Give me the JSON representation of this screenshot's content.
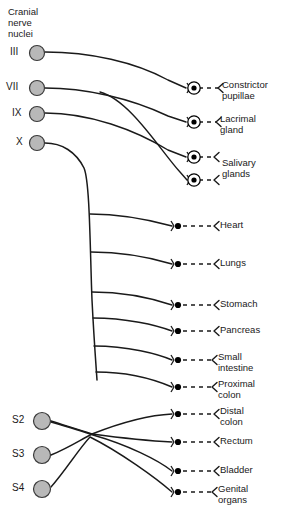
{
  "figure": {
    "heading": "Cranial\nnerve\nnuclei",
    "colors": {
      "background": "#ffffff",
      "line": "#1a1a1a",
      "nucleus_fill": "#b8b8b8",
      "nucleus_stroke": "#3a3a3a",
      "ganglion": "#000000",
      "text": "#1a1a1a"
    }
  },
  "nuclei": [
    {
      "id": "III",
      "label": "III",
      "cx": 37,
      "cy": 53,
      "r": 7.5,
      "label_x": 10,
      "label_y": 46
    },
    {
      "id": "VII",
      "label": "VII",
      "cx": 37,
      "cy": 88,
      "r": 7.5,
      "label_x": 6,
      "label_y": 81
    },
    {
      "id": "IX",
      "label": "IX",
      "cx": 37,
      "cy": 114,
      "r": 7.5,
      "label_x": 12,
      "label_y": 107
    },
    {
      "id": "X",
      "label": "X",
      "cx": 37,
      "cy": 143,
      "r": 7.5,
      "label_x": 16,
      "label_y": 136
    },
    {
      "id": "S2",
      "label": "S2",
      "cx": 42,
      "cy": 421,
      "r": 8.5,
      "label_x": 12,
      "label_y": 414
    },
    {
      "id": "S3",
      "label": "S3",
      "cx": 42,
      "cy": 455,
      "r": 8.5,
      "label_x": 12,
      "label_y": 448
    },
    {
      "id": "S4",
      "label": "S4",
      "cx": 42,
      "cy": 489,
      "r": 8.5,
      "label_x": 12,
      "label_y": 482
    }
  ],
  "targets": [
    {
      "name": "constrictor-pupillae",
      "label": "Constrictor\npupillae",
      "ganglion_type": "encircled",
      "gx": 194,
      "gy": 88,
      "dash_to": 218,
      "label_x": 222,
      "label_y": 80,
      "source": "III",
      "path": "M 45 52 C 90 52 135 62 168 80 L 186 88"
    },
    {
      "name": "lacrimal-gland",
      "label": "Lacrimal\ngland",
      "ganglion_type": "encircled",
      "gx": 194,
      "gy": 122,
      "dash_to": 216,
      "label_x": 220,
      "label_y": 114,
      "source": "VII",
      "path": "M 45 88 C 85 88 130 98 168 116 L 186 122"
    },
    {
      "name": "salivary-glands-upper",
      "label": "Salivary\nglands",
      "ganglion_type": "encircled",
      "gx": 194,
      "gy": 157,
      "dash_to": 214,
      "label_x": 222,
      "label_y": 158,
      "source": "IX",
      "path": "M 45 113 C 90 113 135 130 168 150 L 186 157"
    },
    {
      "name": "salivary-glands-lower",
      "label": "",
      "ganglion_type": "encircled",
      "gx": 194,
      "gy": 180,
      "dash_to": 214,
      "label_x": 0,
      "label_y": 0,
      "source": "VII",
      "path": "M 100 92 C 130 100 160 150 180 172 L 187 180"
    },
    {
      "name": "heart",
      "label": "Heart",
      "ganglion_type": "dot",
      "gx": 178,
      "gy": 226,
      "dash_to": 214,
      "label_x": 220,
      "label_y": 220,
      "source": "X",
      "path": "M 90 214 C 120 214 150 220 172 226"
    },
    {
      "name": "lungs",
      "label": "Lungs",
      "ganglion_type": "dot",
      "gx": 178,
      "gy": 264,
      "dash_to": 214,
      "label_x": 220,
      "label_y": 258,
      "source": "X",
      "path": "M 91 252 C 122 252 152 258 172 264"
    },
    {
      "name": "stomach",
      "label": "Stomach",
      "ganglion_type": "dot",
      "gx": 178,
      "gy": 305,
      "dash_to": 214,
      "label_x": 220,
      "label_y": 299,
      "source": "X",
      "path": "M 92 292 C 124 292 154 299 172 305"
    },
    {
      "name": "pancreas",
      "label": "Pancreas",
      "ganglion_type": "dot",
      "gx": 178,
      "gy": 331,
      "dash_to": 214,
      "label_x": 220,
      "label_y": 325,
      "source": "X",
      "path": "M 93 318 C 126 318 156 325 172 331"
    },
    {
      "name": "small-intestine",
      "label": "Small\nintestine",
      "ganglion_type": "dot",
      "gx": 178,
      "gy": 360,
      "dash_to": 212,
      "label_x": 218,
      "label_y": 352,
      "source": "X",
      "path": "M 94 346 C 128 346 158 354 172 360"
    },
    {
      "name": "proximal-colon",
      "label": "Proximal\ncolon",
      "ganglion_type": "dot",
      "gx": 178,
      "gy": 387,
      "dash_to": 212,
      "label_x": 218,
      "label_y": 379,
      "source": "X",
      "path": "M 96 372 C 130 372 158 381 172 387"
    },
    {
      "name": "distal-colon",
      "label": "Distal\ncolon",
      "ganglion_type": "dot",
      "gx": 178,
      "gy": 414,
      "dash_to": 214,
      "label_x": 220,
      "label_y": 406,
      "source": "S3",
      "path": "M 51 455 C 70 447 80 440 92 434 C 120 423 150 415 172 414"
    },
    {
      "name": "rectum",
      "label": "Rectum",
      "ganglion_type": "dot",
      "gx": 178,
      "gy": 442,
      "dash_to": 214,
      "label_x": 220,
      "label_y": 436,
      "source": "S2",
      "path": "M 51 421 C 70 427 80 430 92 434 C 122 438 152 441 172 442"
    },
    {
      "name": "bladder",
      "label": "Bladder",
      "ganglion_type": "dot",
      "gx": 178,
      "gy": 471,
      "dash_to": 214,
      "label_x": 220,
      "label_y": 465,
      "source": "S2",
      "path": "M 51 422 C 72 428 82 431 93 435 C 128 445 158 460 172 471"
    },
    {
      "name": "genital-organs",
      "label": "Genital\norgans",
      "ganglion_type": "dot",
      "gx": 178,
      "gy": 492,
      "dash_to": 212,
      "label_x": 218,
      "label_y": 484,
      "source": "S4",
      "path": "M 51 487 C 66 470 78 450 90 437 C 120 452 156 478 172 492"
    }
  ],
  "vagus_trunk": {
    "name": "vagus-trunk",
    "path": "M 45 143 C 62 143 76 152 84 168 C 90 182 90 250 92 300 C 94 340 96 365 97 380"
  }
}
